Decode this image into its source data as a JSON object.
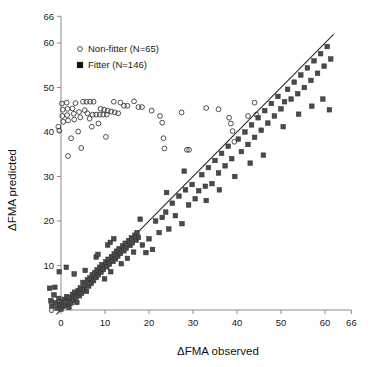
{
  "chart_data": {
    "type": "scatter",
    "title": "",
    "xlabel": "ΔFMA observed",
    "ylabel": "ΔFMA predicted",
    "xlim": [
      -3,
      66
    ],
    "ylim": [
      -2,
      66
    ],
    "xticks": [
      0,
      10,
      20,
      30,
      40,
      50,
      60,
      66
    ],
    "xticklabels": [
      "0",
      "10",
      "20",
      "30",
      "40",
      "50",
      "60",
      "66"
    ],
    "yticks": [
      0,
      10,
      20,
      30,
      40,
      50,
      60,
      66
    ],
    "yticklabels": [
      "0",
      "10",
      "20",
      "30",
      "40",
      "50",
      "60",
      "66"
    ],
    "grid": false,
    "legend_position": "upper-center",
    "annotations": [
      {
        "kind": "line",
        "label": "identity line",
        "x0": -1,
        "y0": -1,
        "x1": 62,
        "y1": 62
      }
    ],
    "series": [
      {
        "name": "Non-fitter  (N=65)",
        "marker": "open-circle",
        "count": 65,
        "color": "#3a3a3a",
        "points": [
          [
            0.2,
            46.4
          ],
          [
            0.4,
            45.0
          ],
          [
            0.3,
            43.6
          ],
          [
            0.5,
            42.3
          ],
          [
            -0.6,
            41.2
          ],
          [
            -0.4,
            40.3
          ],
          [
            1.3,
            46.6
          ],
          [
            1.5,
            45.2
          ],
          [
            1.4,
            43.8
          ],
          [
            1.6,
            42.6
          ],
          [
            2.6,
            45.3
          ],
          [
            2.9,
            44.1
          ],
          [
            3.0,
            42.8
          ],
          [
            3.3,
            46.5
          ],
          [
            4.1,
            44.5
          ],
          [
            4.4,
            43.3
          ],
          [
            5.0,
            46.8
          ],
          [
            5.8,
            46.8
          ],
          [
            6.6,
            46.8
          ],
          [
            7.4,
            46.8
          ],
          [
            6.0,
            44.2
          ],
          [
            6.5,
            43.0
          ],
          [
            7.2,
            43.9
          ],
          [
            8.0,
            43.9
          ],
          [
            8.8,
            43.9
          ],
          [
            9.6,
            43.9
          ],
          [
            10.4,
            43.9
          ],
          [
            9.0,
            45.2
          ],
          [
            9.8,
            45.0
          ],
          [
            10.6,
            44.8
          ],
          [
            11.4,
            44.6
          ],
          [
            12.2,
            44.4
          ],
          [
            13.0,
            44.2
          ],
          [
            12.0,
            46.8
          ],
          [
            13.5,
            46.6
          ],
          [
            14.3,
            45.9
          ],
          [
            15.1,
            45.9
          ],
          [
            8.5,
            41.9
          ],
          [
            7.0,
            41.2
          ],
          [
            3.9,
            40.1
          ],
          [
            2.3,
            38.6
          ],
          [
            4.6,
            36.4
          ],
          [
            1.6,
            34.6
          ],
          [
            10.2,
            38.9
          ],
          [
            16.6,
            46.9
          ],
          [
            17.6,
            45.6
          ],
          [
            18.4,
            45.6
          ],
          [
            22.5,
            43.6
          ],
          [
            23.0,
            42.1
          ],
          [
            23.3,
            38.6
          ],
          [
            23.5,
            36.3
          ],
          [
            28.6,
            36.0
          ],
          [
            29.1,
            36.0
          ],
          [
            33.0,
            45.4
          ],
          [
            35.8,
            45.1
          ],
          [
            38.2,
            43.2
          ],
          [
            38.6,
            41.9
          ],
          [
            39.0,
            40.2
          ],
          [
            39.4,
            37.8
          ],
          [
            42.5,
            43.6
          ],
          [
            44.0,
            46.6
          ],
          [
            44.4,
            43.9
          ],
          [
            27.4,
            44.4
          ],
          [
            20.6,
            44.8
          ],
          [
            5.4,
            44.9
          ]
        ]
      },
      {
        "name": "Fitter (N=146)",
        "marker": "filled-square",
        "count": 146,
        "color": "#4a4a4a",
        "points": [
          [
            -2.3,
            2.1
          ],
          [
            -2.1,
            0.9
          ],
          [
            -1.6,
            3.4
          ],
          [
            -1.2,
            1.6
          ],
          [
            -0.9,
            0.4
          ],
          [
            -0.5,
            2.6
          ],
          [
            -0.3,
            1.3
          ],
          [
            0.0,
            0.2
          ],
          [
            0.2,
            1.9
          ],
          [
            0.5,
            0.8
          ],
          [
            0.8,
            2.4
          ],
          [
            1.0,
            1.1
          ],
          [
            1.3,
            3.0
          ],
          [
            1.5,
            1.8
          ],
          [
            1.8,
            0.6
          ],
          [
            2.0,
            2.8
          ],
          [
            2.3,
            1.6
          ],
          [
            2.6,
            3.5
          ],
          [
            2.9,
            2.2
          ],
          [
            3.1,
            4.0
          ],
          [
            3.4,
            2.9
          ],
          [
            3.6,
            1.7
          ],
          [
            3.9,
            4.4
          ],
          [
            4.2,
            3.2
          ],
          [
            4.4,
            5.0
          ],
          [
            4.7,
            3.8
          ],
          [
            5.0,
            6.2
          ],
          [
            5.2,
            4.6
          ],
          [
            5.5,
            5.6
          ],
          [
            5.8,
            4.2
          ],
          [
            6.0,
            6.8
          ],
          [
            6.3,
            5.4
          ],
          [
            6.6,
            7.2
          ],
          [
            6.9,
            6.0
          ],
          [
            7.1,
            7.9
          ],
          [
            7.4,
            6.6
          ],
          [
            7.7,
            8.4
          ],
          [
            8.0,
            7.3
          ],
          [
            8.2,
            9.0
          ],
          [
            8.5,
            7.9
          ],
          [
            8.8,
            9.6
          ],
          [
            9.1,
            8.5
          ],
          [
            9.3,
            10.2
          ],
          [
            9.6,
            9.1
          ],
          [
            9.9,
            7.0
          ],
          [
            10.2,
            10.8
          ],
          [
            10.4,
            9.7
          ],
          [
            10.7,
            11.4
          ],
          [
            11.0,
            10.3
          ],
          [
            11.3,
            8.6
          ],
          [
            11.5,
            12.0
          ],
          [
            11.8,
            10.9
          ],
          [
            12.1,
            12.6
          ],
          [
            12.4,
            11.5
          ],
          [
            12.6,
            13.2
          ],
          [
            12.9,
            12.1
          ],
          [
            13.2,
            13.8
          ],
          [
            13.5,
            12.7
          ],
          [
            13.7,
            10.4
          ],
          [
            14.0,
            14.4
          ],
          [
            14.3,
            13.3
          ],
          [
            14.6,
            15.0
          ],
          [
            14.8,
            13.9
          ],
          [
            15.1,
            11.6
          ],
          [
            15.4,
            15.6
          ],
          [
            15.7,
            14.5
          ],
          [
            16.0,
            16.2
          ],
          [
            16.2,
            15.1
          ],
          [
            16.5,
            13.0
          ],
          [
            16.8,
            16.8
          ],
          [
            17.1,
            15.7
          ],
          [
            17.3,
            17.4
          ],
          [
            17.6,
            16.3
          ],
          [
            3.0,
            8.1
          ],
          [
            5.5,
            8.9
          ],
          [
            8.0,
            11.9
          ],
          [
            8.4,
            12.5
          ],
          [
            10.6,
            14.6
          ],
          [
            11.2,
            15.2
          ],
          [
            12.0,
            16.0
          ],
          [
            -2.6,
            4.9
          ],
          [
            -1.4,
            5.1
          ],
          [
            -0.4,
            8.6
          ],
          [
            1.2,
            9.6
          ],
          [
            18.5,
            14.6
          ],
          [
            19.3,
            12.9
          ],
          [
            20.0,
            16.0
          ],
          [
            20.8,
            13.6
          ],
          [
            21.5,
            20.0
          ],
          [
            22.3,
            17.4
          ],
          [
            23.0,
            20.8
          ],
          [
            23.8,
            22.0
          ],
          [
            24.5,
            18.2
          ],
          [
            25.3,
            24.0
          ],
          [
            26.0,
            21.2
          ],
          [
            26.8,
            25.6
          ],
          [
            27.5,
            19.4
          ],
          [
            28.3,
            27.0
          ],
          [
            29.0,
            23.6
          ],
          [
            29.8,
            28.2
          ],
          [
            30.5,
            25.0
          ],
          [
            31.3,
            26.8
          ],
          [
            32.0,
            30.4
          ],
          [
            32.8,
            27.8
          ],
          [
            33.5,
            32.0
          ],
          [
            34.3,
            28.4
          ],
          [
            35.0,
            33.6
          ],
          [
            35.8,
            30.8
          ],
          [
            36.5,
            35.2
          ],
          [
            37.3,
            32.4
          ],
          [
            38.0,
            36.8
          ],
          [
            38.8,
            34.0
          ],
          [
            39.5,
            30.0
          ],
          [
            40.3,
            38.4
          ],
          [
            41.0,
            35.6
          ],
          [
            41.8,
            40.0
          ],
          [
            42.5,
            37.2
          ],
          [
            43.3,
            41.6
          ],
          [
            44.0,
            38.8
          ],
          [
            44.8,
            43.2
          ],
          [
            45.5,
            40.4
          ],
          [
            46.3,
            44.8
          ],
          [
            47.0,
            42.0
          ],
          [
            47.8,
            46.4
          ],
          [
            48.5,
            43.6
          ],
          [
            49.3,
            48.0
          ],
          [
            50.0,
            45.2
          ],
          [
            50.8,
            46.8
          ],
          [
            51.5,
            49.6
          ],
          [
            52.3,
            47.4
          ],
          [
            53.0,
            51.2
          ],
          [
            53.8,
            48.6
          ],
          [
            54.5,
            52.8
          ],
          [
            55.3,
            50.0
          ],
          [
            56.0,
            54.4
          ],
          [
            56.8,
            51.6
          ],
          [
            57.5,
            56.0
          ],
          [
            58.3,
            53.2
          ],
          [
            59.0,
            57.6
          ],
          [
            59.8,
            54.8
          ],
          [
            60.5,
            59.2
          ],
          [
            61.3,
            56.4
          ],
          [
            18.0,
            20.4
          ],
          [
            24.0,
            26.4
          ],
          [
            28.0,
            31.2
          ],
          [
            33.0,
            24.6
          ],
          [
            36.0,
            27.0
          ],
          [
            43.0,
            33.0
          ],
          [
            46.0,
            34.8
          ],
          [
            50.5,
            41.2
          ],
          [
            54.0,
            44.0
          ],
          [
            57.0,
            45.8
          ],
          [
            59.5,
            47.4
          ],
          [
            61.0,
            45.0
          ]
        ]
      }
    ]
  },
  "legend": {
    "items": [
      {
        "label": "Non-fitter  (N=65)",
        "marker": "open-circle"
      },
      {
        "label": "Fitter (N=146)",
        "marker": "filled-square"
      }
    ]
  },
  "axes": {
    "x_title": "ΔFMA observed",
    "y_title": "ΔFMA predicted"
  }
}
